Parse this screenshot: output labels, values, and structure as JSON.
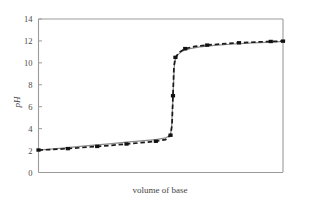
{
  "chart_data": {
    "type": "line",
    "title": "",
    "xlabel": "volume of base",
    "ylabel": "pH",
    "xlim": [
      0,
      100
    ],
    "ylim": [
      0,
      14
    ],
    "grid": false,
    "legend": "none",
    "y_ticks": [
      "0",
      "2",
      "4",
      "6",
      "8",
      "10",
      "12",
      "14"
    ],
    "y_tick_values": [
      0,
      2,
      4,
      6,
      8,
      10,
      12,
      14
    ],
    "x_ticks": [],
    "x_tick_values": [],
    "series": [
      {
        "name": "theoretical curve",
        "style": "solid",
        "color": "#8c8c8c",
        "markers": "none",
        "x": [
          0,
          6,
          12,
          18,
          24,
          30,
          36,
          42,
          48,
          52,
          54,
          54.5,
          55,
          55.5,
          56,
          57,
          59,
          62,
          66,
          72,
          80,
          88,
          96,
          100
        ],
        "y": [
          2.05,
          2.15,
          2.27,
          2.4,
          2.52,
          2.64,
          2.76,
          2.88,
          3.0,
          3.15,
          3.45,
          4.3,
          7.0,
          9.6,
          10.35,
          10.75,
          11.1,
          11.3,
          11.45,
          11.6,
          11.72,
          11.82,
          11.9,
          11.95
        ]
      },
      {
        "name": "measured curve",
        "style": "dashed",
        "color": "#1a1a1a",
        "markers": "square",
        "x": [
          0,
          6,
          12,
          18,
          24,
          30,
          36,
          42,
          48,
          52,
          54,
          54.6,
          55,
          55.4,
          56,
          57.5,
          60,
          64,
          69,
          75,
          82,
          89,
          95,
          100
        ],
        "y": [
          2.05,
          2.1,
          2.18,
          2.28,
          2.38,
          2.48,
          2.6,
          2.72,
          2.85,
          3.0,
          3.4,
          4.3,
          7.0,
          9.7,
          10.5,
          10.95,
          11.3,
          11.5,
          11.62,
          11.73,
          11.83,
          11.9,
          11.95,
          11.98
        ]
      }
    ],
    "marker_points": {
      "x": [
        0,
        12,
        24,
        36,
        48,
        54,
        55,
        56,
        60,
        69,
        82,
        95,
        100
      ],
      "y": [
        2.05,
        2.18,
        2.38,
        2.6,
        2.85,
        3.4,
        7.0,
        10.5,
        11.3,
        11.62,
        11.83,
        11.95,
        11.98
      ]
    }
  },
  "axes": {
    "y_title": "pH",
    "x_title": "volume of base"
  }
}
